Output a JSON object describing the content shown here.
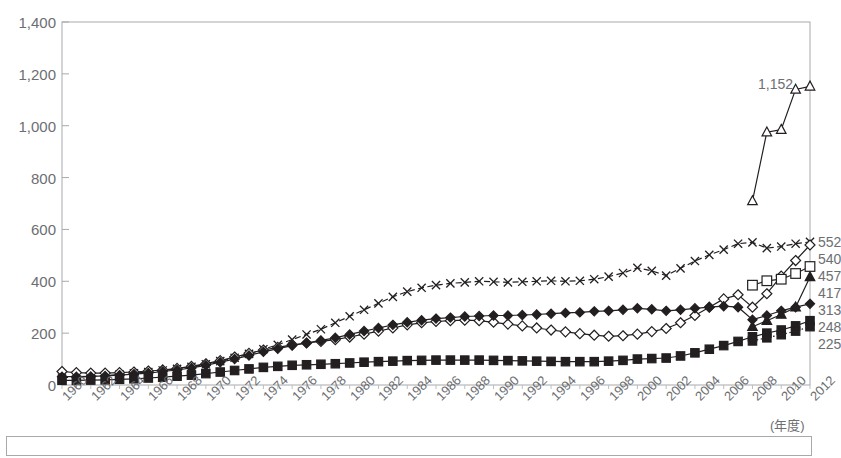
{
  "chart_data": {
    "type": "line",
    "title": "",
    "subtitle": "",
    "xlabel": "(年度)",
    "ylabel": "",
    "ylim": [
      0,
      1400
    ],
    "ytick_step": 200,
    "yticks": [
      "0",
      "200",
      "400",
      "600",
      "800",
      "1,000",
      "1,200",
      "1,400"
    ],
    "grid": false,
    "legend_position": "right-end-labels",
    "x": [
      1960,
      1961,
      1962,
      1963,
      1964,
      1965,
      1966,
      1967,
      1968,
      1969,
      1970,
      1971,
      1972,
      1973,
      1974,
      1975,
      1976,
      1977,
      1978,
      1979,
      1980,
      1981,
      1982,
      1983,
      1984,
      1985,
      1986,
      1987,
      1988,
      1989,
      1990,
      1991,
      1992,
      1993,
      1994,
      1995,
      1996,
      1997,
      1998,
      1999,
      2000,
      2001,
      2002,
      2003,
      2004,
      2005,
      2006,
      2007,
      2008,
      2009,
      2010,
      2011,
      2012
    ],
    "xticks": [
      "1960",
      "1962",
      "1964",
      "1966",
      "1968",
      "1970",
      "1972",
      "1974",
      "1976",
      "1978",
      "1980",
      "1982",
      "1984",
      "1986",
      "1988",
      "1990",
      "1992",
      "1994",
      "1996",
      "1998",
      "2000",
      "2002",
      "2004",
      "2006",
      "2008",
      "2010",
      "2012"
    ],
    "series": [
      {
        "name": "series-cross",
        "marker": "cross",
        "line": "dashed",
        "end_label": "552",
        "values": [
          28,
          30,
          33,
          36,
          40,
          45,
          50,
          56,
          62,
          70,
          80,
          92,
          105,
          120,
          138,
          155,
          175,
          195,
          215,
          240,
          265,
          290,
          315,
          340,
          360,
          375,
          385,
          392,
          396,
          400,
          398,
          396,
          398,
          400,
          402,
          400,
          402,
          408,
          418,
          432,
          452,
          440,
          422,
          450,
          478,
          502,
          522,
          545,
          550,
          528,
          534,
          545,
          552
        ]
      },
      {
        "name": "series-open-diamond",
        "marker": "open-diamond",
        "line": "solid",
        "end_label": "540",
        "values": [
          52,
          48,
          46,
          46,
          48,
          50,
          54,
          58,
          64,
          72,
          82,
          94,
          108,
          122,
          135,
          145,
          155,
          162,
          168,
          175,
          185,
          196,
          208,
          220,
          232,
          240,
          245,
          248,
          250,
          248,
          242,
          235,
          228,
          220,
          212,
          205,
          198,
          192,
          188,
          190,
          196,
          206,
          218,
          240,
          268,
          300,
          332,
          348,
          300,
          352,
          420,
          480,
          540
        ]
      },
      {
        "name": "series-open-square",
        "marker": "open-square",
        "line": "solid",
        "end_label": "457",
        "values": [
          null,
          null,
          null,
          null,
          null,
          null,
          null,
          null,
          null,
          null,
          null,
          null,
          null,
          null,
          null,
          null,
          null,
          null,
          null,
          null,
          null,
          null,
          null,
          null,
          null,
          null,
          null,
          null,
          null,
          null,
          null,
          null,
          null,
          null,
          null,
          null,
          null,
          null,
          null,
          null,
          null,
          null,
          null,
          null,
          null,
          null,
          null,
          null,
          385,
          402,
          408,
          430,
          457
        ]
      },
      {
        "name": "series-filled-triangle",
        "marker": "filled-triangle",
        "line": "solid",
        "end_label": "417",
        "values": [
          null,
          null,
          null,
          null,
          null,
          null,
          null,
          null,
          null,
          null,
          null,
          null,
          null,
          null,
          null,
          null,
          null,
          null,
          null,
          null,
          null,
          null,
          null,
          null,
          null,
          null,
          null,
          null,
          null,
          null,
          null,
          null,
          null,
          null,
          null,
          null,
          null,
          null,
          null,
          null,
          null,
          null,
          null,
          null,
          null,
          null,
          null,
          null,
          225,
          248,
          272,
          300,
          417
        ]
      },
      {
        "name": "series-filled-diamond",
        "marker": "filled-diamond",
        "line": "solid",
        "end_label": "313",
        "values": [
          32,
          32,
          33,
          35,
          38,
          42,
          46,
          52,
          58,
          66,
          76,
          88,
          100,
          114,
          128,
          140,
          152,
          162,
          172,
          182,
          195,
          208,
          220,
          232,
          242,
          250,
          256,
          260,
          264,
          266,
          268,
          268,
          270,
          272,
          275,
          278,
          280,
          284,
          286,
          290,
          296,
          292,
          286,
          290,
          296,
          300,
          304,
          300,
          252,
          268,
          286,
          300,
          313
        ]
      },
      {
        "name": "series-filled-square-solid",
        "marker": "filled-square",
        "line": "solid",
        "end_label": "248",
        "values": [
          18,
          18,
          19,
          20,
          22,
          24,
          27,
          30,
          34,
          38,
          44,
          50,
          56,
          62,
          68,
          72,
          76,
          78,
          80,
          82,
          85,
          88,
          90,
          92,
          94,
          95,
          96,
          96,
          96,
          96,
          95,
          94,
          93,
          92,
          91,
          90,
          90,
          90,
          92,
          95,
          100,
          102,
          104,
          112,
          124,
          138,
          152,
          168,
          186,
          200,
          212,
          228,
          248
        ]
      },
      {
        "name": "series-filled-square-dotted",
        "marker": "filled-square",
        "line": "dotted",
        "end_label": "225",
        "values": [
          null,
          null,
          null,
          null,
          null,
          null,
          null,
          null,
          null,
          null,
          null,
          null,
          null,
          null,
          null,
          null,
          null,
          null,
          null,
          null,
          null,
          null,
          null,
          null,
          null,
          null,
          null,
          null,
          null,
          null,
          null,
          null,
          null,
          null,
          null,
          null,
          null,
          null,
          null,
          null,
          null,
          null,
          null,
          null,
          null,
          null,
          null,
          null,
          170,
          182,
          194,
          208,
          225
        ]
      },
      {
        "name": "series-open-triangle",
        "marker": "open-triangle",
        "line": "solid",
        "end_label": "1,152",
        "values": [
          null,
          null,
          null,
          null,
          null,
          null,
          null,
          null,
          null,
          null,
          null,
          null,
          null,
          null,
          null,
          null,
          null,
          null,
          null,
          null,
          null,
          null,
          null,
          null,
          null,
          null,
          null,
          null,
          null,
          null,
          null,
          null,
          null,
          null,
          null,
          null,
          null,
          null,
          null,
          null,
          null,
          null,
          null,
          null,
          null,
          null,
          null,
          null,
          710,
          975,
          985,
          1140,
          1152
        ]
      }
    ],
    "annotations": [
      {
        "name": "peak-label",
        "text": "1,152"
      }
    ]
  },
  "axis": {
    "x_unit_label": "(年度)"
  }
}
